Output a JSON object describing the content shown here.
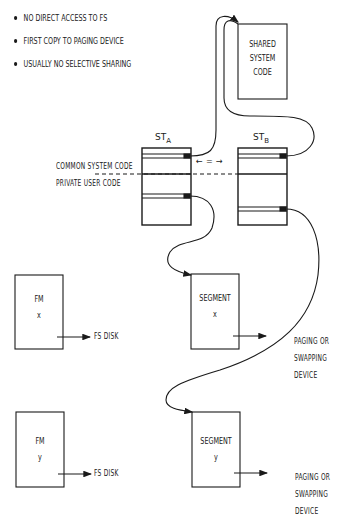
{
  "bullets": [
    "NO DIRECT ACCESS TO FS",
    "FIRST COPY TO PAGING DEVICE",
    "USUALLY NO SELECTIVE SHARING"
  ],
  "shared_box": {
    "lines": [
      "SHARED",
      "SYSTEM",
      "CODE"
    ]
  },
  "segment_tables": {
    "a": {
      "label": "ST",
      "sub": "A"
    },
    "b": {
      "label": "ST",
      "sub": "B"
    }
  },
  "equivalence_symbol": "← = →",
  "region_labels": {
    "common": "COMMON SYSTEM CODE",
    "private": "PRIVATE USER CODE"
  },
  "fm_boxes": [
    {
      "title": "FM",
      "id": "x",
      "target": "FS DISK"
    },
    {
      "title": "FM",
      "id": "y",
      "target": "FS DISK"
    }
  ],
  "segment_boxes": [
    {
      "title": "SEGMENT",
      "id": "x",
      "target_lines": [
        "PAGING OR",
        "SWAPPING",
        "DEVICE"
      ]
    },
    {
      "title": "SEGMENT",
      "id": "y",
      "target_lines": [
        "PAGING OR",
        "SWAPPING",
        "DEVICE"
      ]
    }
  ],
  "colors": {
    "ink": "#1a1a1a",
    "background": "#ffffff"
  }
}
